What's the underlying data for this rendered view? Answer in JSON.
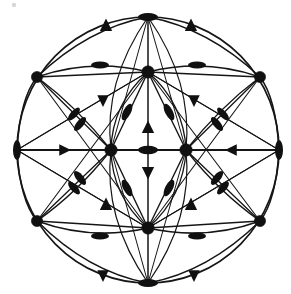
{
  "figure": {
    "background_color": "#ffffff",
    "ink_color": "#101010",
    "canvas": {
      "width": 291,
      "height": 294
    }
  },
  "boundary": {
    "name": "outer-circle",
    "cx": 148,
    "cy": 150,
    "rx": 131,
    "ry": 133,
    "stroke_width": 1.7
  },
  "geometry": {
    "hubs": [
      {
        "id": "hub-top",
        "x": 148,
        "y": 72,
        "r": 6.2
      },
      {
        "id": "hub-left",
        "x": 111,
        "y": 150,
        "r": 6.2
      },
      {
        "id": "hub-right",
        "x": 186,
        "y": 150,
        "r": 6.2
      },
      {
        "id": "hub-bottom",
        "x": 148,
        "y": 228,
        "r": 6.2
      }
    ],
    "corners": [
      {
        "id": "corner-top-left",
        "x": 37,
        "y": 77,
        "r": 5.6
      },
      {
        "id": "corner-top-right",
        "x": 260,
        "y": 77,
        "r": 5.6
      },
      {
        "id": "corner-bottom-left",
        "x": 37,
        "y": 221,
        "r": 5.6
      },
      {
        "id": "corner-bottom-right",
        "x": 260,
        "y": 221,
        "r": 5.6
      }
    ],
    "rim_points": [
      {
        "id": "rim-top",
        "x": 148,
        "y": 17
      },
      {
        "id": "rim-bottom",
        "x": 148,
        "y": 283
      },
      {
        "id": "rim-left",
        "x": 17,
        "y": 150
      },
      {
        "id": "rim-right",
        "x": 279,
        "y": 150
      }
    ]
  },
  "edges": {
    "straight": [
      {
        "name": "spoke-rimtop-hubtop",
        "x1": 148,
        "y1": 17,
        "x2": 148,
        "y2": 72,
        "w": 1.5
      },
      {
        "name": "spoke-hubtop-center",
        "x1": 148,
        "y1": 72,
        "x2": 148,
        "y2": 150,
        "w": 1.5
      },
      {
        "name": "spoke-center-hubbottom",
        "x1": 148,
        "y1": 150,
        "x2": 148,
        "y2": 228,
        "w": 1.5
      },
      {
        "name": "spoke-hubbottom-rimbottom",
        "x1": 148,
        "y1": 228,
        "x2": 148,
        "y2": 283,
        "w": 1.5
      },
      {
        "name": "axis-rimleft-hubleft",
        "x1": 17,
        "y1": 150,
        "x2": 111,
        "y2": 150,
        "w": 2.2
      },
      {
        "name": "axis-hubleft-hubright",
        "x1": 111,
        "y1": 150,
        "x2": 186,
        "y2": 150,
        "w": 2.2
      },
      {
        "name": "axis-hubright-rimright",
        "x1": 186,
        "y1": 150,
        "x2": 279,
        "y2": 150,
        "w": 2.2
      },
      {
        "name": "hubtop-cornertl",
        "x1": 148,
        "y1": 72,
        "x2": 37,
        "y2": 77,
        "w": 1.3
      },
      {
        "name": "hubtop-cornertr",
        "x1": 148,
        "y1": 72,
        "x2": 260,
        "y2": 77,
        "w": 1.3
      },
      {
        "name": "hubbot-cornerbl",
        "x1": 148,
        "y1": 228,
        "x2": 37,
        "y2": 221,
        "w": 1.3
      },
      {
        "name": "hubbot-cornerbr",
        "x1": 148,
        "y1": 228,
        "x2": 260,
        "y2": 221,
        "w": 1.3
      },
      {
        "name": "cornertl-hubleft",
        "x1": 37,
        "y1": 77,
        "x2": 111,
        "y2": 150,
        "w": 1.3
      },
      {
        "name": "cornertr-hubright",
        "x1": 260,
        "y1": 77,
        "x2": 186,
        "y2": 150,
        "w": 1.3
      },
      {
        "name": "cornerbl-hubleft",
        "x1": 37,
        "y1": 221,
        "x2": 111,
        "y2": 150,
        "w": 1.3
      },
      {
        "name": "cornerbr-hubright",
        "x1": 260,
        "y1": 221,
        "x2": 186,
        "y2": 150,
        "w": 1.3
      },
      {
        "name": "cornertl-hubbottom",
        "x1": 37,
        "y1": 77,
        "x2": 148,
        "y2": 228,
        "w": 1.1
      },
      {
        "name": "cornertr-hubbottom",
        "x1": 260,
        "y1": 77,
        "x2": 148,
        "y2": 228,
        "w": 1.1
      },
      {
        "name": "cornerbl-hubtop",
        "x1": 37,
        "y1": 221,
        "x2": 148,
        "y2": 72,
        "w": 1.1
      },
      {
        "name": "cornerbr-hubtop",
        "x1": 260,
        "y1": 221,
        "x2": 148,
        "y2": 72,
        "w": 1.1
      },
      {
        "name": "hubtop-hubleft",
        "x1": 148,
        "y1": 72,
        "x2": 111,
        "y2": 150,
        "w": 1.4
      },
      {
        "name": "hubtop-hubright",
        "x1": 148,
        "y1": 72,
        "x2": 186,
        "y2": 150,
        "w": 1.4
      },
      {
        "name": "hubbottom-hubleft",
        "x1": 148,
        "y1": 228,
        "x2": 111,
        "y2": 150,
        "w": 1.4
      },
      {
        "name": "hubbottom-hubright",
        "x1": 148,
        "y1": 228,
        "x2": 186,
        "y2": 150,
        "w": 1.4
      },
      {
        "name": "hubleft-rimtop",
        "x1": 111,
        "y1": 150,
        "x2": 148,
        "y2": 17,
        "w": 1.0
      },
      {
        "name": "hubright-rimtop",
        "x1": 186,
        "y1": 150,
        "x2": 148,
        "y2": 17,
        "w": 1.0
      },
      {
        "name": "hubleft-rimbottom",
        "x1": 111,
        "y1": 150,
        "x2": 148,
        "y2": 283,
        "w": 1.0
      },
      {
        "name": "hubright-rimbottom",
        "x1": 186,
        "y1": 150,
        "x2": 148,
        "y2": 283,
        "w": 1.0
      },
      {
        "name": "hubtop-rimleft",
        "x1": 148,
        "y1": 72,
        "x2": 17,
        "y2": 150,
        "w": 1.0
      },
      {
        "name": "hubtop-rimright",
        "x1": 148,
        "y1": 72,
        "x2": 279,
        "y2": 150,
        "w": 1.0
      },
      {
        "name": "hubbottom-rimleft",
        "x1": 148,
        "y1": 228,
        "x2": 17,
        "y2": 150,
        "w": 1.0
      },
      {
        "name": "hubbottom-rimright",
        "x1": 148,
        "y1": 228,
        "x2": 279,
        "y2": 150,
        "w": 1.0
      }
    ],
    "arcs": [
      {
        "name": "arc-cornertl-rimtop",
        "d": "M37,77 Q88,28 148,17",
        "w": 1.5
      },
      {
        "name": "arc-rimtop-cornertr",
        "d": "M148,17 Q208,28 260,77",
        "w": 1.5
      },
      {
        "name": "arc-cornerbl-rimbottom",
        "d": "M37,221 Q88,272 148,283",
        "w": 1.5
      },
      {
        "name": "arc-rimbottom-cornerbr",
        "d": "M148,283 Q208,272 260,221",
        "w": 1.5
      },
      {
        "name": "arc-rimleft-cornertl",
        "d": "M17,150 Q20,98 37,77",
        "w": 1.5
      },
      {
        "name": "arc-rimleft-cornerbl",
        "d": "M17,150 Q20,201 37,221",
        "w": 1.5
      },
      {
        "name": "arc-rimright-cornertr",
        "d": "M279,150 Q276,98 260,77",
        "w": 1.5
      },
      {
        "name": "arc-rimright-cornerbr",
        "d": "M279,150 Q276,201 260,221",
        "w": 1.5
      },
      {
        "name": "arc-cornertl-hubtop",
        "d": "M37,77 Q92,58 148,72",
        "w": 1.6
      },
      {
        "name": "arc-hubtop-cornertr",
        "d": "M148,72 Q205,58 260,77",
        "w": 1.6
      },
      {
        "name": "arc-cornerbl-hubbottom",
        "d": "M37,221 Q92,241 148,228",
        "w": 1.6
      },
      {
        "name": "arc-hubbottom-cornerbr",
        "d": "M148,228 Q205,241 260,221",
        "w": 1.6
      },
      {
        "name": "arc-cornertl-hubleft-out",
        "d": "M37,77 Q78,108 111,150",
        "w": 1.3
      },
      {
        "name": "arc-cornertr-hubright-out",
        "d": "M260,77 Q219,108 186,150",
        "w": 1.3
      },
      {
        "name": "arc-cornerbl-hubleft-out",
        "d": "M37,221 Q78,192 111,150",
        "w": 1.3
      },
      {
        "name": "arc-cornerbr-hubright-out",
        "d": "M260,221 Q219,192 186,150",
        "w": 1.3
      },
      {
        "name": "arc-rimtop-hubleft-in",
        "d": "M148,17 Q103,82 111,150",
        "w": 1.2
      },
      {
        "name": "arc-rimtop-hubright-in",
        "d": "M148,17 Q193,82 186,150",
        "w": 1.2
      },
      {
        "name": "arc-rimbottom-hubleft-in",
        "d": "M148,283 Q103,218 111,150",
        "w": 1.2
      },
      {
        "name": "arc-rimbottom-hubright-in",
        "d": "M148,283 Q193,218 186,150",
        "w": 1.2
      },
      {
        "name": "arc-rimleft-hubtop-in",
        "d": "M17,150 Q80,112 148,72",
        "w": 1.2
      },
      {
        "name": "arc-rimright-hubtop-in",
        "d": "M279,150 Q216,112 148,72",
        "w": 1.2
      },
      {
        "name": "arc-rimleft-hubbottom-in",
        "d": "M17,150 Q80,188 148,228",
        "w": 1.2
      },
      {
        "name": "arc-rimright-hubbottom-in",
        "d": "M279,150 Q216,188 148,228",
        "w": 1.2
      },
      {
        "name": "arc-hubtop-hubleft-bow",
        "d": "M148,72 Q112,104 111,150",
        "w": 1.3
      },
      {
        "name": "arc-hubtop-hubright-bow",
        "d": "M148,72 Q184,104 186,150",
        "w": 1.3
      },
      {
        "name": "arc-hubbottom-hubleft-bow",
        "d": "M148,228 Q112,196 111,150",
        "w": 1.3
      },
      {
        "name": "arc-hubbottom-hubright-bow",
        "d": "M148,228 Q184,196 186,150",
        "w": 1.3
      }
    ]
  },
  "markers": {
    "ellipses": [
      {
        "name": "marker-rim-top",
        "cx": 148,
        "cy": 17,
        "rx": 10,
        "ry": 4.0,
        "angle": 0
      },
      {
        "name": "marker-rim-bottom",
        "cx": 148,
        "cy": 283,
        "rx": 10,
        "ry": 4.0,
        "angle": 0
      },
      {
        "name": "marker-rim-left",
        "cx": 17,
        "cy": 150,
        "rx": 4.0,
        "ry": 10,
        "angle": 0
      },
      {
        "name": "marker-rim-right",
        "cx": 279,
        "cy": 150,
        "rx": 4.0,
        "ry": 10,
        "angle": 0
      },
      {
        "name": "marker-center",
        "cx": 148,
        "cy": 150,
        "rx": 10,
        "ry": 4.2,
        "angle": 0
      },
      {
        "name": "marker-up-left",
        "cx": 100,
        "cy": 65,
        "rx": 9,
        "ry": 3.6,
        "angle": 0
      },
      {
        "name": "marker-up-right",
        "cx": 197,
        "cy": 65,
        "rx": 9,
        "ry": 3.6,
        "angle": 0
      },
      {
        "name": "marker-low-left",
        "cx": 100,
        "cy": 236,
        "rx": 9,
        "ry": 3.6,
        "angle": 0
      },
      {
        "name": "marker-low-right",
        "cx": 197,
        "cy": 236,
        "rx": 9,
        "ry": 3.6,
        "angle": 0
      },
      {
        "name": "marker-diag-tl-inner",
        "cx": 127,
        "cy": 112,
        "rx": 3.8,
        "ry": 9,
        "angle": 28
      },
      {
        "name": "marker-diag-tr-inner",
        "cx": 169,
        "cy": 112,
        "rx": 3.8,
        "ry": 9,
        "angle": -28
      },
      {
        "name": "marker-diag-bl-inner",
        "cx": 127,
        "cy": 188,
        "rx": 3.8,
        "ry": 9,
        "angle": -28
      },
      {
        "name": "marker-diag-br-inner",
        "cx": 169,
        "cy": 188,
        "rx": 3.8,
        "ry": 9,
        "angle": 28
      },
      {
        "name": "marker-diag-tl-outer",
        "cx": 80,
        "cy": 124,
        "rx": 3.6,
        "ry": 8.5,
        "angle": 40
      },
      {
        "name": "marker-diag-tr-outer",
        "cx": 217,
        "cy": 124,
        "rx": 3.6,
        "ry": 8.5,
        "angle": -40
      },
      {
        "name": "marker-diag-bl-outer",
        "cx": 80,
        "cy": 178,
        "rx": 3.6,
        "ry": 8.5,
        "angle": -40
      },
      {
        "name": "marker-diag-br-outer",
        "cx": 217,
        "cy": 178,
        "rx": 3.6,
        "ry": 8.5,
        "angle": 40
      },
      {
        "name": "marker-mid-left-up",
        "cx": 74,
        "cy": 114,
        "rx": 3.4,
        "ry": 8,
        "angle": 42
      },
      {
        "name": "marker-mid-right-up",
        "cx": 223,
        "cy": 114,
        "rx": 3.4,
        "ry": 8,
        "angle": -42
      },
      {
        "name": "marker-mid-left-dn",
        "cx": 74,
        "cy": 188,
        "rx": 3.4,
        "ry": 8,
        "angle": -42
      },
      {
        "name": "marker-mid-right-dn",
        "cx": 223,
        "cy": 188,
        "rx": 3.4,
        "ry": 8,
        "angle": 42
      }
    ],
    "triangles": [
      {
        "name": "marker-arrow-up-tl",
        "cx": 106,
        "cy": 26,
        "size": 7.5,
        "dir": "up"
      },
      {
        "name": "marker-arrow-up-tr",
        "cx": 191,
        "cy": 26,
        "size": 7.5,
        "dir": "up"
      },
      {
        "name": "marker-arrow-up-bl",
        "cx": 106,
        "cy": 205,
        "size": 7.5,
        "dir": "up"
      },
      {
        "name": "marker-arrow-up-br",
        "cx": 191,
        "cy": 205,
        "size": 7.5,
        "dir": "up"
      },
      {
        "name": "marker-arrow-dn-tl",
        "cx": 103,
        "cy": 100,
        "size": 7.0,
        "dir": "down"
      },
      {
        "name": "marker-arrow-dn-tr",
        "cx": 194,
        "cy": 100,
        "size": 7.0,
        "dir": "down"
      },
      {
        "name": "marker-arrow-dn-bl",
        "cx": 103,
        "cy": 275,
        "size": 7.0,
        "dir": "down"
      },
      {
        "name": "marker-arrow-dn-br",
        "cx": 194,
        "cy": 275,
        "size": 7.0,
        "dir": "down"
      },
      {
        "name": "marker-arrow-up-center",
        "cx": 148,
        "cy": 128,
        "size": 7.5,
        "dir": "up"
      },
      {
        "name": "marker-arrow-dn-center",
        "cx": 148,
        "cy": 172,
        "size": 7.5,
        "dir": "down"
      },
      {
        "name": "marker-arrow-right-left",
        "cx": 64,
        "cy": 150,
        "size": 7.0,
        "dir": "right"
      },
      {
        "name": "marker-arrow-left-right",
        "cx": 232,
        "cy": 150,
        "size": 7.0,
        "dir": "left"
      }
    ]
  }
}
